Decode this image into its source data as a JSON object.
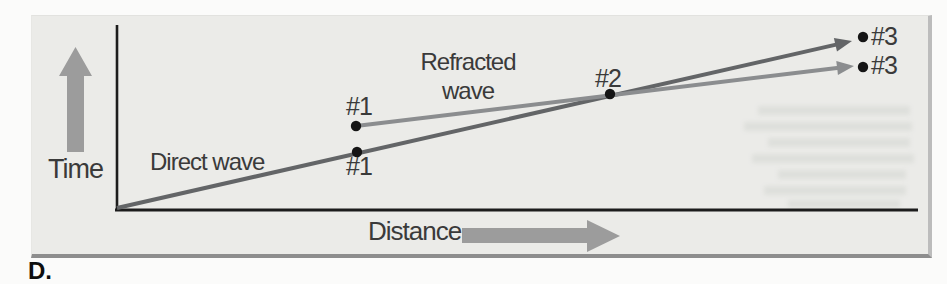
{
  "figure": {
    "panel_label": "D.",
    "axes": {
      "y_label": "Time",
      "x_label": "Distance"
    },
    "labels": {
      "direct": "Direct wave",
      "refracted": "Refracted wave"
    },
    "points": {
      "p1_upper": "#1",
      "p1_lower": "#1",
      "p2": "#2",
      "p3_upper": "#3",
      "p3_lower": "#3"
    },
    "colors": {
      "panel_bg": "#ebebe8",
      "axis": "#1c1c1c",
      "direct_wave": "#636567",
      "refracted_wave": "#8b8d8f",
      "dot": "#151515",
      "axis_arrow": "#9c9c9c",
      "text": "#3a3a3a"
    },
    "geometry": {
      "axis_lines": [
        {
          "name": "y-axis",
          "x1": 117,
          "y1": 25,
          "x2": 117,
          "y2": 211,
          "width": 2.6
        },
        {
          "name": "x-axis",
          "x1": 115,
          "y1": 210,
          "x2": 918,
          "y2": 210,
          "width": 2.8
        }
      ],
      "wave_lines": [
        {
          "name": "direct-wave",
          "x1": 117,
          "y1": 208,
          "x2": 852,
          "y2": 41,
          "color": "#636567",
          "width": 4
        },
        {
          "name": "refracted-wave",
          "x1": 356,
          "y1": 126,
          "x2": 854,
          "y2": 66,
          "color": "#8b8d8f",
          "width": 4
        }
      ],
      "arrowhead": {
        "length": 17,
        "half_width": 7
      },
      "dots": [
        {
          "name": "point-1-refracted",
          "x": 356,
          "y": 126
        },
        {
          "name": "point-1-direct",
          "x": 357,
          "y": 152
        },
        {
          "name": "point-2-crossover",
          "x": 610,
          "y": 94
        },
        {
          "name": "point-3-direct",
          "x": 863,
          "y": 37
        },
        {
          "name": "point-3-refracted",
          "x": 863,
          "y": 67
        }
      ],
      "dot_radius": 5.2,
      "axis_arrows": [
        {
          "name": "time-axis-arrow",
          "points": "67,152 67,76 59,76 75.5,47 92,76 84,76 84,152"
        },
        {
          "name": "distance-axis-arrow",
          "points": "462,228 587,228 587,220 620,236 587,252 587,243 462,243"
        }
      ],
      "print_bleed_rects": [
        [
          758,
          106,
          152,
          9
        ],
        [
          744,
          122,
          168,
          9
        ],
        [
          768,
          138,
          142,
          9
        ],
        [
          752,
          154,
          162,
          9
        ],
        [
          778,
          170,
          128,
          9
        ],
        [
          764,
          186,
          142,
          9
        ],
        [
          788,
          200,
          112,
          8
        ]
      ]
    }
  },
  "chart_data": {
    "type": "line",
    "xlabel": "Distance",
    "ylabel": "Time",
    "axes_numeric": false,
    "series": [
      {
        "name": "Direct wave",
        "points_px": [
          [
            117,
            208
          ],
          [
            852,
            41
          ]
        ]
      },
      {
        "name": "Refracted wave",
        "points_px": [
          [
            356,
            126
          ],
          [
            854,
            66
          ]
        ]
      }
    ],
    "marked_points": [
      {
        "label": "#1",
        "series": "Refracted wave",
        "px": [
          356,
          126
        ]
      },
      {
        "label": "#1",
        "series": "Direct wave",
        "px": [
          357,
          152
        ]
      },
      {
        "label": "#2",
        "series": "crossover",
        "px": [
          610,
          94
        ]
      },
      {
        "label": "#3",
        "series": "Direct wave",
        "px": [
          863,
          37
        ]
      },
      {
        "label": "#3",
        "series": "Refracted wave",
        "px": [
          863,
          67
        ]
      }
    ]
  }
}
